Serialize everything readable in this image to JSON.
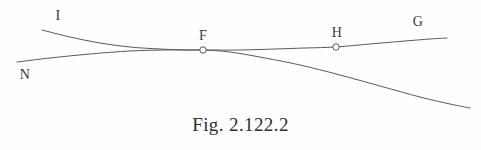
{
  "figure": {
    "caption": "Fig. 2.122.2",
    "background_color": "#fefefe",
    "stroke_color": "#5a5a5a",
    "label_color": "#3a3a3a",
    "width": 481,
    "height": 150
  },
  "labels": {
    "i": "I",
    "n": "N",
    "f": "F",
    "h": "H",
    "g": "G"
  },
  "chart_data": {
    "type": "line",
    "title": "Fig. 2.122.2",
    "xlabel": "",
    "ylabel": "",
    "grid": false,
    "legend": "none",
    "xlim": [
      0,
      481
    ],
    "ylim": [
      150,
      0
    ],
    "annotations": [
      {
        "text": "I",
        "x": 58,
        "y": 16
      },
      {
        "text": "N",
        "x": 25,
        "y": 75
      },
      {
        "text": "F",
        "x": 203,
        "y": 36
      },
      {
        "text": "H",
        "x": 337,
        "y": 33
      },
      {
        "text": "G",
        "x": 418,
        "y": 22
      }
    ],
    "markers": [
      {
        "name": "F",
        "x": 203,
        "y": 50,
        "style": "open-circle"
      },
      {
        "name": "H",
        "x": 336,
        "y": 47,
        "style": "open-circle"
      }
    ],
    "series": [
      {
        "name": "curve-I-to-descending",
        "from_label": "I",
        "to_label": "",
        "points": [
          [
            42,
            30
          ],
          [
            70,
            37
          ],
          [
            100,
            43
          ],
          [
            130,
            47
          ],
          [
            160,
            49
          ],
          [
            185,
            50
          ],
          [
            203,
            50
          ],
          [
            230,
            52
          ],
          [
            265,
            58
          ],
          [
            300,
            65
          ],
          [
            340,
            75
          ],
          [
            380,
            86
          ],
          [
            420,
            97
          ],
          [
            450,
            104
          ],
          [
            470,
            108
          ]
        ]
      },
      {
        "name": "curve-N-to-G",
        "from_label": "N",
        "to_label": "G",
        "points": [
          [
            17,
            62
          ],
          [
            50,
            58
          ],
          [
            90,
            54
          ],
          [
            130,
            51
          ],
          [
            165,
            50
          ],
          [
            190,
            50
          ],
          [
            203,
            50
          ],
          [
            240,
            50
          ],
          [
            275,
            49
          ],
          [
            305,
            48
          ],
          [
            336,
            47
          ],
          [
            370,
            44
          ],
          [
            405,
            41
          ],
          [
            430,
            39
          ],
          [
            447,
            38
          ]
        ]
      }
    ]
  }
}
